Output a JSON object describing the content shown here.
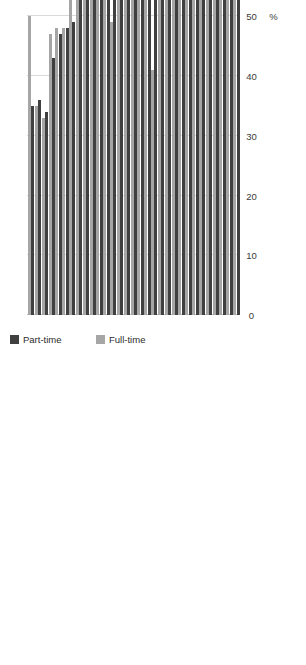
{
  "chart_data": {
    "type": "bar",
    "orientation": "horizontal-rotated",
    "title": "",
    "xlabel": "",
    "ylabel": "%",
    "axis_label": "%",
    "ylim": [
      0,
      100
    ],
    "tick_labels": [
      "0",
      "10",
      "20",
      "30",
      "40",
      "50",
      "60",
      "70",
      "80",
      "90",
      "100"
    ],
    "tick_values": [
      0,
      10,
      20,
      30,
      40,
      50,
      60,
      70,
      80,
      90,
      100
    ],
    "grid": true,
    "legend_position": "top-left",
    "categories": [
      "Cyprus",
      "Czech Rep",
      "Greece",
      "Slovenia",
      "Germany",
      "Portugal",
      "Lithuania",
      "Denmark",
      "Estonia",
      "Italy",
      "Croatia",
      "Norway",
      "Austria",
      "France",
      "Belgium",
      "Finland",
      "Switzerland",
      "Slovakia",
      "Sweden",
      "Luxembourg",
      "EU30",
      "Hungary",
      "Bulgaria",
      "Spain",
      "Romania",
      "UK",
      "Poland",
      "Ireland",
      "Latvia",
      "Netherlands",
      "Malta"
    ],
    "series": [
      {
        "name": "Part-time",
        "color": "#404040",
        "values": [
          35,
          36,
          34,
          43,
          47,
          48,
          49,
          54,
          56,
          57,
          57,
          56,
          57,
          55,
          60,
          60,
          62,
          61,
          62,
          66,
          67,
          69,
          72,
          70,
          61,
          71,
          59,
          72,
          73,
          81,
          81
        ]
      },
      {
        "name": "Full-time",
        "color": "#a6a6a6",
        "values": [
          50,
          35,
          33,
          47,
          48,
          48,
          57,
          65,
          75,
          65,
          57,
          55,
          49,
          56,
          56,
          65,
          71,
          61,
          41,
          77,
          85,
          63,
          65,
          70,
          60,
          70,
          58,
          72,
          73,
          85,
          78
        ]
      }
    ],
    "annotations": [
      {
        "text": "85%",
        "refers_to": "EU30 Full-time"
      },
      {
        "text": "67%",
        "refers_to": "EU30 Part-time"
      }
    ]
  },
  "legend": {
    "items": [
      {
        "label": "Part-time",
        "color": "#404040"
      },
      {
        "label": "Full-time",
        "color": "#a6a6a6"
      }
    ]
  }
}
